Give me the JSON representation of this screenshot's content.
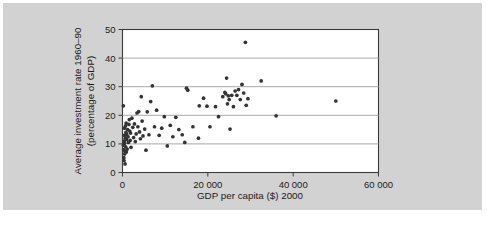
{
  "figure": {
    "background_color": "#d2d2d2",
    "plot_background_color": "#ffffff",
    "frame_color": "#3b3b3b",
    "grid_color": "#a9a9a9",
    "marker_color": "#333333"
  },
  "chart_data": {
    "type": "scatter",
    "title": "",
    "xlabel": "GDP per capita ($) 2000",
    "ylabel": "Average investment rate 1960–90 (percentage of GDP)",
    "ylabel_line1": "Average investment rate 1960–90",
    "ylabel_line2": "(percentage of GDP)",
    "xlim": [
      0,
      60000
    ],
    "ylim": [
      0,
      50
    ],
    "xticks": [
      0,
      20000,
      40000,
      60000
    ],
    "xtick_labels": [
      "0",
      "20 000",
      "40 000",
      "60 000"
    ],
    "yticks": [
      0,
      10,
      20,
      30,
      40,
      50
    ],
    "ytick_labels": [
      "0",
      "10",
      "20",
      "30",
      "40",
      "50"
    ],
    "grid": "horizontal",
    "legend": "none",
    "marker": "circle",
    "marker_size": 3,
    "points": [
      [
        200,
        23.3
      ],
      [
        250,
        9.5
      ],
      [
        300,
        8.0
      ],
      [
        320,
        5.2
      ],
      [
        350,
        4.2
      ],
      [
        380,
        11.0
      ],
      [
        420,
        13.0
      ],
      [
        450,
        15.5
      ],
      [
        480,
        10.2
      ],
      [
        520,
        6.5
      ],
      [
        560,
        7.5
      ],
      [
        600,
        3.0
      ],
      [
        650,
        12.0
      ],
      [
        700,
        16.3
      ],
      [
        750,
        9.0
      ],
      [
        800,
        14.0
      ],
      [
        850,
        17.3
      ],
      [
        900,
        7.2
      ],
      [
        950,
        11.5
      ],
      [
        1000,
        13.3
      ],
      [
        1100,
        8.2
      ],
      [
        1200,
        15.0
      ],
      [
        1300,
        12.5
      ],
      [
        1400,
        10.5
      ],
      [
        1500,
        16.8
      ],
      [
        1600,
        18.5
      ],
      [
        1700,
        14.5
      ],
      [
        1800,
        11.2
      ],
      [
        1900,
        13.8
      ],
      [
        2000,
        8.8
      ],
      [
        2200,
        19.0
      ],
      [
        2400,
        15.8
      ],
      [
        2600,
        12.2
      ],
      [
        2800,
        17.0
      ],
      [
        3000,
        10.8
      ],
      [
        3200,
        13.5
      ],
      [
        3400,
        20.8
      ],
      [
        3600,
        16.0
      ],
      [
        3800,
        21.3
      ],
      [
        4000,
        14.2
      ],
      [
        4200,
        11.8
      ],
      [
        4400,
        26.5
      ],
      [
        4600,
        18.0
      ],
      [
        4800,
        12.8
      ],
      [
        5200,
        15.2
      ],
      [
        5500,
        7.8
      ],
      [
        5800,
        21.2
      ],
      [
        6200,
        13.2
      ],
      [
        6600,
        24.8
      ],
      [
        7000,
        30.3
      ],
      [
        7500,
        16.0
      ],
      [
        8000,
        21.8
      ],
      [
        8600,
        13.0
      ],
      [
        9200,
        15.5
      ],
      [
        9800,
        19.5
      ],
      [
        10500,
        9.3
      ],
      [
        11200,
        16.5
      ],
      [
        11800,
        12.5
      ],
      [
        12500,
        19.3
      ],
      [
        13200,
        15.0
      ],
      [
        14000,
        13.2
      ],
      [
        14600,
        10.5
      ],
      [
        15000,
        29.5
      ],
      [
        15300,
        28.8
      ],
      [
        16500,
        16.0
      ],
      [
        17800,
        12.0
      ],
      [
        18000,
        23.3
      ],
      [
        19000,
        26.0
      ],
      [
        19800,
        23.2
      ],
      [
        20500,
        16.0
      ],
      [
        21800,
        23.0
      ],
      [
        22500,
        19.5
      ],
      [
        23500,
        26.5
      ],
      [
        24000,
        28.0
      ],
      [
        24200,
        27.5
      ],
      [
        24400,
        33.0
      ],
      [
        24600,
        24.0
      ],
      [
        24800,
        26.8
      ],
      [
        25000,
        25.5
      ],
      [
        25200,
        15.2
      ],
      [
        25600,
        27.0
      ],
      [
        26000,
        23.0
      ],
      [
        26400,
        28.5
      ],
      [
        26800,
        27.0
      ],
      [
        27200,
        29.0
      ],
      [
        27600,
        25.5
      ],
      [
        28000,
        30.8
      ],
      [
        28400,
        27.8
      ],
      [
        28800,
        45.5
      ],
      [
        29000,
        23.5
      ],
      [
        29400,
        25.8
      ],
      [
        32500,
        32.0
      ],
      [
        36000,
        19.8
      ],
      [
        50000,
        25.0
      ]
    ]
  }
}
